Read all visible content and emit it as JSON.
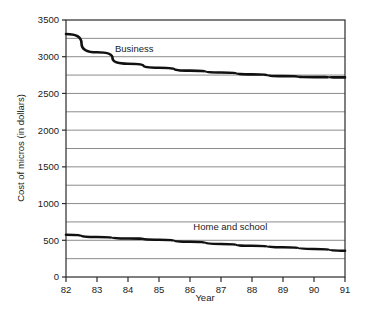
{
  "chart_data": {
    "type": "line",
    "title": "",
    "xlabel": "Year",
    "ylabel": "Cost of micros (in dollars)",
    "x": [
      "82",
      "83",
      "84",
      "85",
      "86",
      "87",
      "88",
      "89",
      "90",
      "91"
    ],
    "xlim": [
      82,
      91
    ],
    "ylim": [
      0,
      3500
    ],
    "yticks": [
      0,
      500,
      1000,
      1500,
      2000,
      2500,
      3000,
      3500
    ],
    "ytick_labels": [
      "0",
      "500",
      "1000",
      "1500",
      "2000",
      "2500",
      "3000",
      "3500"
    ],
    "gridline_step": 250,
    "grid": true,
    "legend_position": "inline-annotation",
    "series": [
      {
        "name": "Business",
        "label_x": "84.2",
        "label_y": 3060,
        "values": [
          3310,
          3060,
          2905,
          2850,
          2810,
          2785,
          2760,
          2735,
          2722,
          2718
        ]
      },
      {
        "name": "Home and school",
        "label_x": "87.3",
        "label_y": 640,
        "values": [
          575,
          545,
          525,
          508,
          480,
          450,
          425,
          405,
          382,
          358
        ]
      }
    ]
  },
  "axes": {
    "x_axis_title": "Year",
    "y_axis_title": "Cost of micros (in dollars)"
  },
  "style": {
    "line_color": "#111111",
    "grid_color": "#8c8c8c",
    "frame_color": "#2b2b2b",
    "background": "#ffffff"
  }
}
